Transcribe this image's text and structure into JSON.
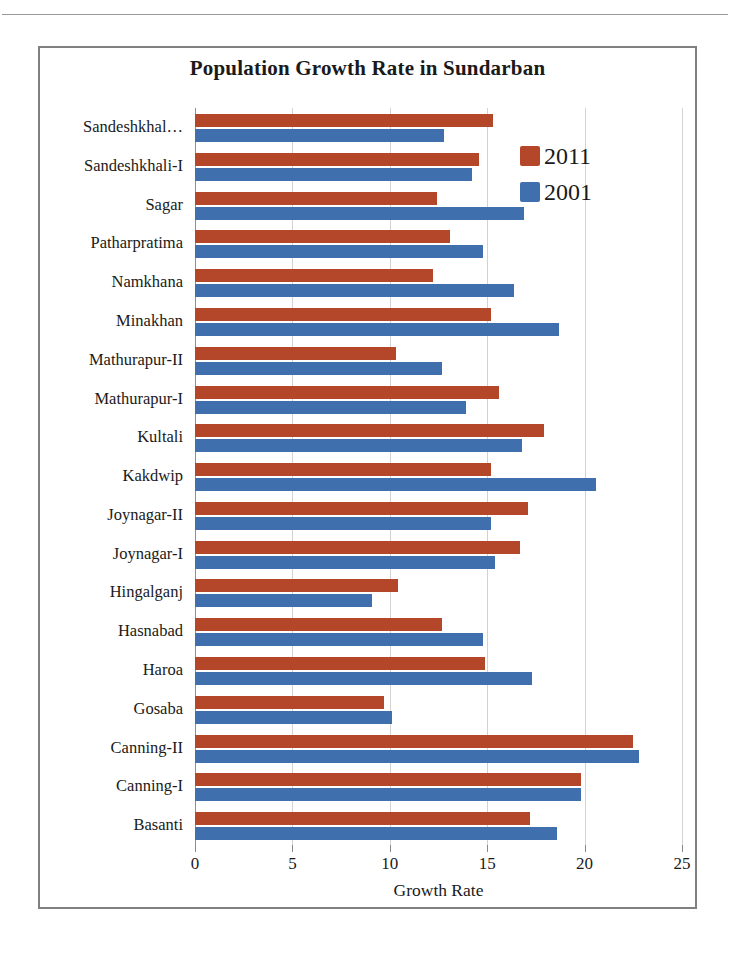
{
  "page": {
    "header_rule_visible": true,
    "header_ghost_center": "",
    "header_ghost_right": ""
  },
  "chart_data": {
    "type": "bar",
    "orientation": "horizontal",
    "title": "Population Growth Rate in Sundarban",
    "xlabel": "Growth Rate",
    "ylabel": "",
    "xlim": [
      0,
      25
    ],
    "xticks": [
      0,
      5,
      10,
      15,
      20,
      25
    ],
    "xtick_labels": [
      "0",
      "5",
      "10",
      "15",
      "20",
      "25"
    ],
    "grid": "vertical",
    "legend_position": "top-right",
    "categories": [
      "Sandeshkhal…",
      "Sandeshkhali-I",
      "Sagar",
      "Patharpratima",
      "Namkhana",
      "Minakhan",
      "Mathurapur-II",
      "Mathurapur-I",
      "Kultali",
      "Kakdwip",
      "Joynagar-II",
      "Joynagar-I",
      "Hingalganj",
      "Hasnabad",
      "Haroa",
      "Gosaba",
      "Canning-II",
      "Canning-I",
      "Basanti"
    ],
    "series": [
      {
        "name": "2011",
        "color": "#b4472a",
        "values": [
          15.3,
          14.6,
          12.4,
          13.1,
          12.2,
          15.2,
          10.3,
          15.6,
          17.9,
          15.2,
          17.1,
          16.7,
          10.4,
          12.7,
          14.9,
          9.7,
          22.5,
          19.8,
          17.2
        ]
      },
      {
        "name": "2001",
        "color": "#3f6fac",
        "values": [
          12.8,
          14.2,
          16.9,
          14.8,
          16.4,
          18.7,
          12.7,
          13.9,
          16.8,
          20.6,
          15.2,
          15.4,
          9.1,
          14.8,
          17.3,
          10.1,
          22.8,
          19.8,
          18.6
        ]
      }
    ]
  },
  "legend": {
    "items": [
      {
        "label": "2011",
        "color": "#b4472a"
      },
      {
        "label": "2001",
        "color": "#3f6fac"
      }
    ]
  }
}
